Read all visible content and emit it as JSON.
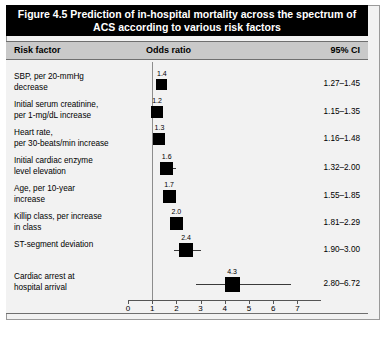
{
  "figure": {
    "title": "Figure 4.5 Prediction of in-hospital mortality across the spectrum of ACS according to various risk factors"
  },
  "table": {
    "headers": {
      "risk_factor": "Risk factor",
      "odds_ratio": "Odds ratio",
      "ci": "95% CI"
    }
  },
  "chart_data": {
    "type": "scatter",
    "title": "Figure 4.5 Prediction of in-hospital mortality across the spectrum of ACS according to various risk factors",
    "xlabel": "Odds ratio",
    "ylabel": "Risk factor",
    "xlim": [
      0,
      7
    ],
    "xticks": [
      0,
      1,
      2,
      3,
      4,
      5,
      6,
      7
    ],
    "xticklabels": [
      "0",
      "1",
      "2",
      "3",
      "4",
      "5",
      "6",
      "7"
    ],
    "reference_line": 1,
    "grid": false,
    "legend": "none",
    "categories": [
      "SBP, per 20-mmHg decrease",
      "Initial serum creatinine, per 1-mg/dL increase",
      "Heart rate, per 30-beats/min increase",
      "Initial cardiac enzyme level elevation",
      "Age, per 10-year increase",
      "Killip class, per increase in class",
      "ST-segment deviation",
      "Cardiac arrest at hospital arrival"
    ],
    "points": [
      {
        "label": "SBP, per 20-mmHg decrease",
        "label_line1": "SBP, per 20-mmHg",
        "label_line2": "decrease",
        "odds_ratio": 1.4,
        "odds_ratio_label": "1.4",
        "ci_low": 1.27,
        "ci_high": 1.45,
        "ci_label": "1.27–1.45"
      },
      {
        "label": "Initial serum creatinine, per 1-mg/dL increase",
        "label_line1": "Initial serum creatinine,",
        "label_line2": "per 1-mg/dL increase",
        "odds_ratio": 1.2,
        "odds_ratio_label": "1.2",
        "ci_low": 1.15,
        "ci_high": 1.35,
        "ci_label": "1.15–1.35"
      },
      {
        "label": "Heart rate, per 30-beats/min increase",
        "label_line1": "Heart rate,",
        "label_line2": "per 30-beats/min increase",
        "odds_ratio": 1.3,
        "odds_ratio_label": "1.3",
        "ci_low": 1.16,
        "ci_high": 1.48,
        "ci_label": "1.16–1.48"
      },
      {
        "label": "Initial cardiac enzyme level elevation",
        "label_line1": "Initial cardiac enzyme",
        "label_line2": "level elevation",
        "odds_ratio": 1.6,
        "odds_ratio_label": "1.6",
        "ci_low": 1.32,
        "ci_high": 2.0,
        "ci_label": "1.32–2.00"
      },
      {
        "label": "Age, per 10-year increase",
        "label_line1": "Age, per 10-year",
        "label_line2": "increase",
        "odds_ratio": 1.7,
        "odds_ratio_label": "1.7",
        "ci_low": 1.55,
        "ci_high": 1.85,
        "ci_label": "1.55–1.85"
      },
      {
        "label": "Killip class, per increase in class",
        "label_line1": "Killip class, per increase",
        "label_line2": "in class",
        "odds_ratio": 2.0,
        "odds_ratio_label": "2.0",
        "ci_low": 1.81,
        "ci_high": 2.29,
        "ci_label": "1.81–2.29"
      },
      {
        "label": "ST-segment deviation",
        "label_line1": "ST-segment deviation",
        "label_line2": "",
        "odds_ratio": 2.4,
        "odds_ratio_label": "2.4",
        "ci_low": 1.9,
        "ci_high": 3.0,
        "ci_label": "1.90–3.00"
      },
      {
        "label": "Cardiac arrest at hospital arrival",
        "label_line1": "Cardiac arrest at",
        "label_line2": "hospital arrival",
        "odds_ratio": 4.3,
        "odds_ratio_label": "4.3",
        "ci_low": 2.8,
        "ci_high": 6.72,
        "ci_label": "2.80–6.72"
      }
    ]
  }
}
